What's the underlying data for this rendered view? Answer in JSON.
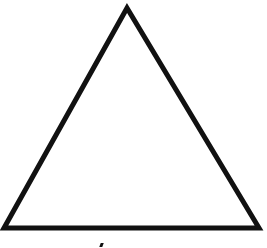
{
  "diagram": {
    "shape": "equilateral-triangle",
    "stroke_color": "#111111",
    "fill_color": "#ffffff",
    "vertices": {
      "apex": [
        127,
        8
      ],
      "bottom_left": [
        4,
        228
      ],
      "bottom_right": [
        259,
        228
      ]
    },
    "stroke_width": 5
  }
}
